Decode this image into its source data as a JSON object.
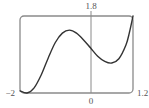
{
  "chart_data": {
    "type": "line",
    "title": "",
    "xlabel": "",
    "ylabel": "",
    "xlim": [
      -2,
      1.2
    ],
    "ylim": [
      0,
      1.8
    ],
    "grid": false,
    "legend": null,
    "tick_labels": {
      "x_left": "-2",
      "x_right": "1.2",
      "x_origin": "0",
      "y_top": "1.8"
    },
    "series": [
      {
        "name": "f(x)",
        "x": [
          -2.0,
          -1.8,
          -1.6,
          -1.4,
          -1.2,
          -1.0,
          -0.8,
          -0.6,
          -0.4,
          -0.2,
          0.0,
          0.2,
          0.4,
          0.6,
          0.8,
          1.0,
          1.1,
          1.2
        ],
        "y": [
          0.05,
          0.0,
          0.12,
          0.42,
          0.82,
          1.18,
          1.4,
          1.47,
          1.4,
          1.24,
          1.05,
          0.86,
          0.74,
          0.7,
          0.8,
          1.12,
          1.42,
          1.8
        ]
      }
    ]
  },
  "labels": {
    "y_top": "1.8",
    "x_left": "−2",
    "x_origin": "0",
    "x_right": "1.2"
  },
  "colors": {
    "frame": "#8a8a8a",
    "axis": "#8a8a8a",
    "curve": "#333333",
    "text": "#555555"
  }
}
